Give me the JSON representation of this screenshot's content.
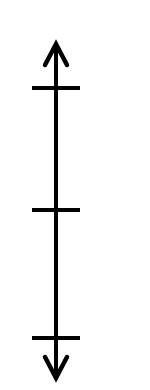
{
  "diagram": {
    "type": "vertical-number-line",
    "orientation": "vertical",
    "colors": {
      "background": "#ffffff",
      "stroke": "#000000"
    },
    "axis": {
      "x": 56,
      "y_start": 44,
      "y_end": 378,
      "stroke_width": 4,
      "arrow_top": true,
      "arrow_bottom": true
    },
    "ticks": [
      {
        "y": 88,
        "x1": 32,
        "x2": 80,
        "label": ""
      },
      {
        "y": 210,
        "x1": 32,
        "x2": 80,
        "label": ""
      },
      {
        "y": 338,
        "x1": 32,
        "x2": 80,
        "label": ""
      }
    ],
    "arrowheads": {
      "top": {
        "tip_y": 44,
        "wing_y": 65,
        "wing_left_x": 45,
        "wing_right_x": 67
      },
      "bottom": {
        "tip_y": 378,
        "wing_y": 357,
        "wing_left_x": 45,
        "wing_right_x": 67
      }
    }
  }
}
